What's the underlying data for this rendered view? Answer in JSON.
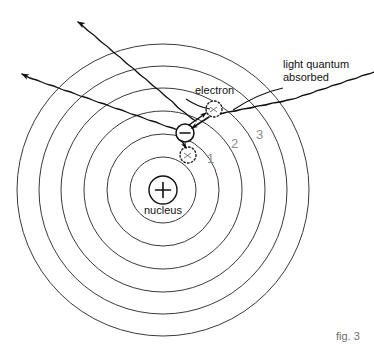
{
  "figure": {
    "caption": "fig. 3",
    "title_alt": "Bohr atom model: absorption and emission of light quanta"
  },
  "labels": {
    "nucleus": "nucleus",
    "electron": "electron",
    "light_quantum_line1": "light quantum",
    "light_quantum_line2": "absorbed",
    "nucleus_charge": "+",
    "electron_charge": "−"
  },
  "shell_labels": [
    {
      "name": "shell-1",
      "text": "1",
      "x": 207,
      "y": 152
    },
    {
      "name": "shell-2",
      "text": "2",
      "x": 231,
      "y": 137
    },
    {
      "name": "shell-3",
      "text": "3",
      "x": 256,
      "y": 128
    }
  ],
  "colors": {
    "stroke": "#1a1a1a",
    "shell_stroke": "#3a3a3a",
    "shell_label": "#8c8c8c",
    "caption": "#6e6e6e",
    "background": "#ffffff"
  },
  "geometry": {
    "center_x": 163,
    "center_y": 190,
    "nucleus_radius": 14,
    "shell_radii": [
      33,
      56,
      79,
      102,
      124,
      146
    ]
  },
  "diagram_elements": {
    "shells_count": 6,
    "emitted_photons": 2,
    "absorbed_photons": 1,
    "ghost_electrons": 2,
    "electron_symbol_name": "electron-minus-circle"
  }
}
